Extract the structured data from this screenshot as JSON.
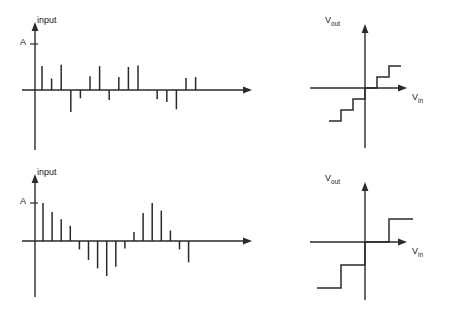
{
  "figure": {
    "title": "",
    "background": "#ffffff",
    "stroke_color": "#2a2a2a",
    "panels": [
      {
        "id": "top-left",
        "role": "input-signal-plot"
      },
      {
        "id": "top-right",
        "role": "quantizer-transfer-fine"
      },
      {
        "id": "bottom-left",
        "role": "input-signal-plot"
      },
      {
        "id": "bottom-right",
        "role": "quantizer-transfer-coarse"
      }
    ]
  },
  "labels": {
    "input": "input",
    "amplitude_tick": "A",
    "vout_main": "V",
    "vout_sub": "out",
    "vin_main": "V",
    "vin_sub": "in"
  },
  "chart_data": [
    {
      "type": "bar",
      "id": "top-left-stem",
      "title": "",
      "ylabel": "input",
      "xlabel": "",
      "ytick_labels": [
        "A"
      ],
      "ytick_values": [
        1.0
      ],
      "ylim": [
        -1.0,
        1.0
      ],
      "grid": false,
      "legend": null,
      "categories": [
        1,
        2,
        3,
        4,
        5,
        6,
        7,
        8,
        9,
        10,
        11,
        12,
        13,
        14,
        15,
        16,
        17,
        18,
        19,
        20,
        21,
        22,
        23,
        24,
        25
      ],
      "values": [
        0.52,
        0.25,
        0.55,
        -0.48,
        -0.18,
        0.3,
        0.52,
        -0.22,
        0.28,
        0.5,
        0.53,
        -0.01,
        -0.2,
        -0.26,
        -0.42,
        0.26,
        0.28,
        0.5,
        0.0,
        0.0,
        0.0,
        0.0,
        0.0,
        0.0,
        0.0
      ]
    },
    {
      "type": "line",
      "id": "top-right-staircase",
      "title": "",
      "xlabel": "Vin",
      "ylabel": "Vout",
      "grid": false,
      "legend": null,
      "step_count_positive": 3,
      "step_count_negative": 3,
      "step_width": 13,
      "step_height": 11,
      "x": [
        -3,
        -3,
        -2,
        -2,
        -1,
        -1,
        0,
        0,
        1,
        1,
        2,
        2,
        3
      ],
      "y": [
        -3,
        -3,
        -3,
        -2,
        -2,
        -1,
        -1,
        0,
        0,
        1,
        1,
        2,
        2
      ]
    },
    {
      "type": "bar",
      "id": "bottom-left-stem",
      "title": "",
      "ylabel": "input",
      "xlabel": "",
      "ytick_labels": [
        "A"
      ],
      "ytick_values": [
        1.0
      ],
      "ylim": [
        -1.0,
        1.0
      ],
      "grid": false,
      "legend": null,
      "categories": [
        1,
        2,
        3,
        4,
        5,
        6,
        7,
        8,
        9,
        10,
        11,
        12,
        13,
        14,
        15,
        16,
        17,
        18,
        19,
        20,
        21,
        22,
        23,
        24,
        25
      ],
      "values": [
        1.0,
        0.76,
        0.57,
        0.4,
        -0.22,
        -0.5,
        -0.72,
        -0.92,
        -0.68,
        -0.2,
        0.24,
        0.74,
        1.0,
        0.8,
        0.28,
        -0.22,
        -0.56,
        0.0,
        0.0,
        0.0,
        0.0,
        0.0,
        0.0,
        0.0,
        0.0
      ]
    },
    {
      "type": "line",
      "id": "bottom-right-staircase",
      "title": "",
      "xlabel": "Vin",
      "ylabel": "Vout",
      "grid": false,
      "legend": null,
      "step_count_positive": 2,
      "step_count_negative": 2,
      "step_width": 24,
      "step_height": 24,
      "x": [
        -2,
        -2,
        -1,
        -1,
        0,
        0,
        1,
        1,
        2
      ],
      "y": [
        -2,
        -2,
        -2,
        -1,
        -1,
        0,
        0,
        1,
        1
      ]
    }
  ]
}
